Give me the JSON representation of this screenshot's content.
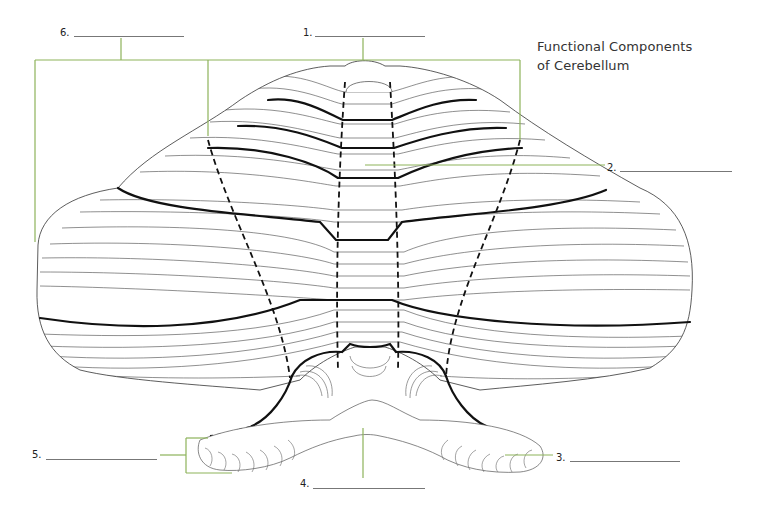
{
  "title": {
    "line1": "Functional Components",
    "line2": "of Cerebellum"
  },
  "colors": {
    "leader_line": "#8db35a",
    "outline": "#222222",
    "blank_line": "#777777",
    "background": "#ffffff"
  },
  "labels": [
    {
      "number": "1.",
      "answer": "",
      "target": "vermis region (top bracket)"
    },
    {
      "number": "2.",
      "answer": "",
      "target": "central vermis"
    },
    {
      "number": "3.",
      "answer": "",
      "target": "right flocculus"
    },
    {
      "number": "4.",
      "answer": "",
      "target": "nodulus"
    },
    {
      "number": "5.",
      "answer": "",
      "target": "left flocculonodular lobe"
    },
    {
      "number": "6.",
      "answer": "",
      "target": "hemisphere region (left bracket)"
    }
  ],
  "figure": {
    "line_styles": [
      "thin folia lines",
      "thick fissure lines",
      "dashed zone boundaries"
    ]
  }
}
